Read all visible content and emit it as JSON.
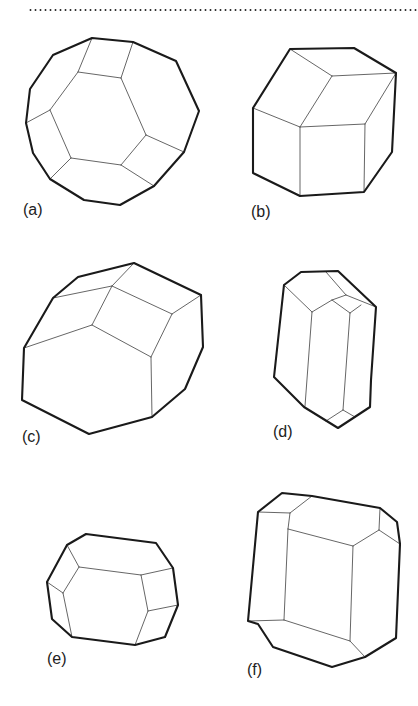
{
  "figure": {
    "panels": [
      {
        "id": "a",
        "label": "(a)",
        "label_pos": [
          23,
          202
        ],
        "outline": [
          [
            92,
            38
          ],
          [
            133,
            42
          ],
          [
            176,
            61
          ],
          [
            199,
            111
          ],
          [
            184,
            152
          ],
          [
            154,
            186
          ],
          [
            120,
            205
          ],
          [
            84,
            200
          ],
          [
            50,
            179
          ],
          [
            33,
            153
          ],
          [
            26,
            123
          ],
          [
            30,
            89
          ],
          [
            53,
            55
          ]
        ],
        "edges": [
          [
            [
              92,
              38
            ],
            [
              78,
              72
            ]
          ],
          [
            [
              133,
              42
            ],
            [
              121,
              78
            ]
          ],
          [
            [
              78,
              72
            ],
            [
              121,
              78
            ]
          ],
          [
            [
              78,
              72
            ],
            [
              50,
              110
            ]
          ],
          [
            [
              121,
              78
            ],
            [
              146,
              135
            ]
          ],
          [
            [
              50,
              110
            ],
            [
              26,
              123
            ]
          ],
          [
            [
              50,
              110
            ],
            [
              71,
              158
            ]
          ],
          [
            [
              146,
              135
            ],
            [
              184,
              152
            ]
          ],
          [
            [
              71,
              158
            ],
            [
              121,
              165
            ]
          ],
          [
            [
              146,
              135
            ],
            [
              121,
              165
            ]
          ],
          [
            [
              71,
              158
            ],
            [
              50,
              179
            ]
          ],
          [
            [
              121,
              165
            ],
            [
              154,
              186
            ]
          ]
        ]
      },
      {
        "id": "b",
        "label": "(b)",
        "label_pos": [
          251,
          204
        ],
        "outline": [
          [
            290,
            49
          ],
          [
            354,
            48
          ],
          [
            396,
            73
          ],
          [
            392,
            152
          ],
          [
            364,
            192
          ],
          [
            300,
            196
          ],
          [
            253,
            173
          ],
          [
            253,
            108
          ]
        ],
        "edges": [
          [
            [
              290,
              49
            ],
            [
              332,
              76
            ]
          ],
          [
            [
              332,
              76
            ],
            [
              396,
              73
            ]
          ],
          [
            [
              332,
              76
            ],
            [
              300,
              127
            ]
          ],
          [
            [
              253,
              108
            ],
            [
              300,
              127
            ]
          ],
          [
            [
              300,
              127
            ],
            [
              365,
              124
            ]
          ],
          [
            [
              365,
              124
            ],
            [
              396,
              73
            ]
          ],
          [
            [
              300,
              127
            ],
            [
              300,
              196
            ]
          ],
          [
            [
              365,
              124
            ],
            [
              364,
              192
            ]
          ]
        ]
      },
      {
        "id": "c",
        "label": "(c)",
        "label_pos": [
          22,
          429
        ],
        "outline": [
          [
            24,
            348
          ],
          [
            53,
            298
          ],
          [
            78,
            277
          ],
          [
            134,
            263
          ],
          [
            201,
            295
          ],
          [
            203,
            347
          ],
          [
            185,
            389
          ],
          [
            152,
            417
          ],
          [
            89,
            434
          ],
          [
            22,
            400
          ]
        ],
        "edges": [
          [
            [
              53,
              298
            ],
            [
              112,
              286
            ]
          ],
          [
            [
              112,
              286
            ],
            [
              134,
              263
            ]
          ],
          [
            [
              112,
              286
            ],
            [
              92,
              325
            ]
          ],
          [
            [
              24,
              348
            ],
            [
              92,
              325
            ]
          ],
          [
            [
              92,
              325
            ],
            [
              151,
              357
            ]
          ],
          [
            [
              112,
              286
            ],
            [
              172,
              314
            ]
          ],
          [
            [
              172,
              314
            ],
            [
              201,
              295
            ]
          ],
          [
            [
              172,
              314
            ],
            [
              151,
              357
            ]
          ],
          [
            [
              151,
              357
            ],
            [
              152,
              417
            ]
          ]
        ]
      },
      {
        "id": "d",
        "label": "(d)",
        "label_pos": [
          273,
          424
        ],
        "outline": [
          [
            284,
            285
          ],
          [
            301,
            272
          ],
          [
            338,
            271
          ],
          [
            376,
            307
          ],
          [
            371,
            380
          ],
          [
            370,
            407
          ],
          [
            338,
            428
          ],
          [
            304,
            407
          ],
          [
            274,
            377
          ]
        ],
        "edges": [
          [
            [
              284,
              285
            ],
            [
              312,
              312
            ]
          ],
          [
            [
              312,
              312
            ],
            [
              332,
              300
            ]
          ],
          [
            [
              332,
              300
            ],
            [
              346,
              295
            ]
          ],
          [
            [
              326,
              272
            ],
            [
              346,
              295
            ]
          ],
          [
            [
              346,
              295
            ],
            [
              376,
              307
            ]
          ],
          [
            [
              332,
              300
            ],
            [
              350,
              313
            ]
          ],
          [
            [
              350,
              313
            ],
            [
              361,
              305
            ]
          ],
          [
            [
              312,
              312
            ],
            [
              305,
              406
            ]
          ],
          [
            [
              350,
              313
            ],
            [
              343,
              410
            ]
          ],
          [
            [
              343,
              410
            ],
            [
              326,
              421
            ]
          ],
          [
            [
              343,
              410
            ],
            [
              355,
              417
            ]
          ]
        ]
      },
      {
        "id": "e",
        "label": "(e)",
        "label_pos": [
          47,
          651
        ],
        "outline": [
          [
            86,
            534
          ],
          [
            156,
            543
          ],
          [
            173,
            568
          ],
          [
            178,
            605
          ],
          [
            165,
            637
          ],
          [
            135,
            645
          ],
          [
            72,
            637
          ],
          [
            52,
            619
          ],
          [
            47,
            582
          ],
          [
            67,
            545
          ]
        ],
        "edges": [
          [
            [
              67,
              545
            ],
            [
              79,
              567
            ]
          ],
          [
            [
              79,
              567
            ],
            [
              141,
              575
            ]
          ],
          [
            [
              141,
              575
            ],
            [
              173,
              568
            ]
          ],
          [
            [
              79,
              567
            ],
            [
              63,
              593
            ]
          ],
          [
            [
              47,
              582
            ],
            [
              63,
              593
            ]
          ],
          [
            [
              63,
              593
            ],
            [
              72,
              637
            ]
          ],
          [
            [
              141,
              575
            ],
            [
              148,
              611
            ]
          ],
          [
            [
              148,
              611
            ],
            [
              178,
              605
            ]
          ],
          [
            [
              148,
              611
            ],
            [
              135,
              645
            ]
          ]
        ]
      },
      {
        "id": "f",
        "label": "(f)",
        "label_pos": [
          247,
          662
        ],
        "outline": [
          [
            282,
            493
          ],
          [
            312,
            496
          ],
          [
            380,
            508
          ],
          [
            397,
            522
          ],
          [
            400,
            544
          ],
          [
            396,
            638
          ],
          [
            365,
            657
          ],
          [
            332,
            667
          ],
          [
            273,
            647
          ],
          [
            258,
            624
          ],
          [
            248,
            621
          ],
          [
            258,
            512
          ]
        ],
        "edges": [
          [
            [
              258,
              512
            ],
            [
              290,
              513
            ]
          ],
          [
            [
              290,
              513
            ],
            [
              312,
              496
            ]
          ],
          [
            [
              290,
              513
            ],
            [
              288,
              529
            ]
          ],
          [
            [
              288,
              529
            ],
            [
              353,
              546
            ]
          ],
          [
            [
              353,
              546
            ],
            [
              379,
              530
            ]
          ],
          [
            [
              379,
              530
            ],
            [
              380,
              508
            ]
          ],
          [
            [
              379,
              530
            ],
            [
              400,
              544
            ]
          ],
          [
            [
              288,
              529
            ],
            [
              284,
              620
            ]
          ],
          [
            [
              248,
              621
            ],
            [
              284,
              620
            ]
          ],
          [
            [
              284,
              620
            ],
            [
              350,
              641
            ]
          ],
          [
            [
              353,
              546
            ],
            [
              350,
              641
            ]
          ],
          [
            [
              350,
              641
            ],
            [
              365,
              657
            ]
          ]
        ]
      }
    ]
  },
  "labels": {
    "a": "(a)",
    "b": "(b)",
    "c": "(c)",
    "d": "(d)",
    "e": "(e)",
    "f": "(f)"
  }
}
